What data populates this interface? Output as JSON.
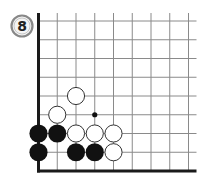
{
  "diagram": {
    "problem_number": "8",
    "board": {
      "columns": 9,
      "rows": 9,
      "origin_x": 38.5,
      "origin_y": 21,
      "spacing": 18.75,
      "edges": [
        "left",
        "bottom"
      ],
      "line_color": "#8a8a8a",
      "edge_color": "#1a1a1a"
    },
    "hoshi": [
      {
        "col": 3,
        "row": 5
      }
    ],
    "stones": [
      {
        "color": "white",
        "col": 2,
        "row": 4
      },
      {
        "color": "white",
        "col": 1,
        "row": 5
      },
      {
        "color": "black",
        "col": 0,
        "row": 6
      },
      {
        "color": "black",
        "col": 1,
        "row": 6
      },
      {
        "color": "white",
        "col": 2,
        "row": 6
      },
      {
        "color": "white",
        "col": 3,
        "row": 6
      },
      {
        "color": "white",
        "col": 4,
        "row": 6
      },
      {
        "color": "black",
        "col": 0,
        "row": 7
      },
      {
        "color": "black",
        "col": 2,
        "row": 7
      },
      {
        "color": "black",
        "col": 3,
        "row": 7
      },
      {
        "color": "white",
        "col": 4,
        "row": 7
      }
    ],
    "colors": {
      "black_stone": "#111111",
      "white_stone_fill": "#ffffff",
      "white_stone_stroke": "#333333",
      "badge_stroke": "#777777"
    }
  }
}
